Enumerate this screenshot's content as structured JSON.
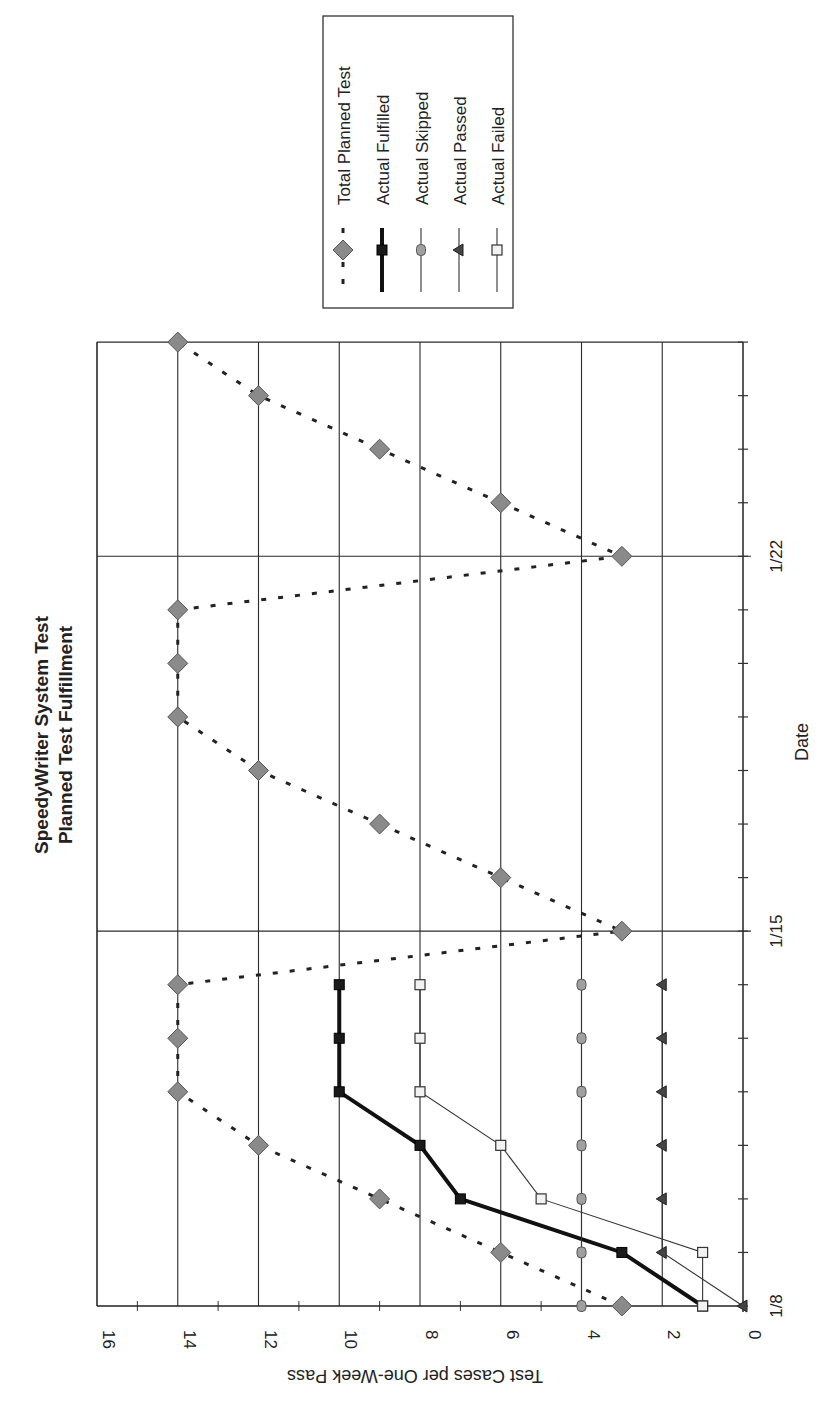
{
  "chart_data": {
    "type": "line",
    "orientation": "rotated-90",
    "title": "SpeedyWriter System Test",
    "subtitle": "Planned Test Fulfillment",
    "xlabel": "Date",
    "ylabel": "Test Cases per One-Week Pass",
    "ylim": [
      0,
      16
    ],
    "y_ticks": [
      "0",
      "2",
      "4",
      "6",
      "8",
      "10",
      "12",
      "14",
      "16"
    ],
    "x_tick_labels": [
      {
        "day": 0,
        "label": "1/8"
      },
      {
        "day": 7,
        "label": "1/15"
      },
      {
        "day": 14,
        "label": "1/22"
      }
    ],
    "x_range_days": [
      0,
      18
    ],
    "grid": true,
    "legend_position": "top-right",
    "series": [
      {
        "name": "Total Planned Test",
        "style": "dashed",
        "marker": "diamond",
        "color": "#8a8a8a",
        "x": [
          0,
          1,
          2,
          3,
          4,
          5,
          6,
          7,
          8,
          9,
          10,
          11,
          12,
          13,
          14,
          15,
          16,
          17,
          18
        ],
        "values": [
          3,
          6,
          9,
          12,
          14,
          14,
          14,
          3,
          6,
          9,
          12,
          14,
          14,
          14,
          3,
          6,
          9,
          12,
          14
        ]
      },
      {
        "name": "Actual Fulfilled",
        "style": "thick",
        "marker": "square-filled",
        "color": "#1a1a1a",
        "x": [
          0,
          1,
          2,
          3,
          4,
          5,
          6
        ],
        "values": [
          1,
          3,
          7,
          8,
          10,
          10,
          10
        ]
      },
      {
        "name": "Actual Skipped",
        "style": "thin",
        "marker": "circle",
        "color": "#9a9a9a",
        "x": [
          0,
          1,
          2,
          3,
          4,
          5,
          6
        ],
        "values": [
          4,
          4,
          4,
          4,
          4,
          4,
          4
        ]
      },
      {
        "name": "Actual Passed",
        "style": "thin",
        "marker": "triangle",
        "color": "#444444",
        "x": [
          0,
          1,
          2,
          3,
          4,
          5,
          6
        ],
        "values": [
          0,
          2,
          2,
          2,
          2,
          2,
          2
        ]
      },
      {
        "name": "Actual Failed",
        "style": "thin",
        "marker": "square-open",
        "color": "#e8e8e8",
        "x": [
          0,
          1,
          2,
          3,
          4,
          5,
          6
        ],
        "values": [
          1,
          1,
          5,
          6,
          8,
          8,
          8
        ]
      }
    ]
  }
}
